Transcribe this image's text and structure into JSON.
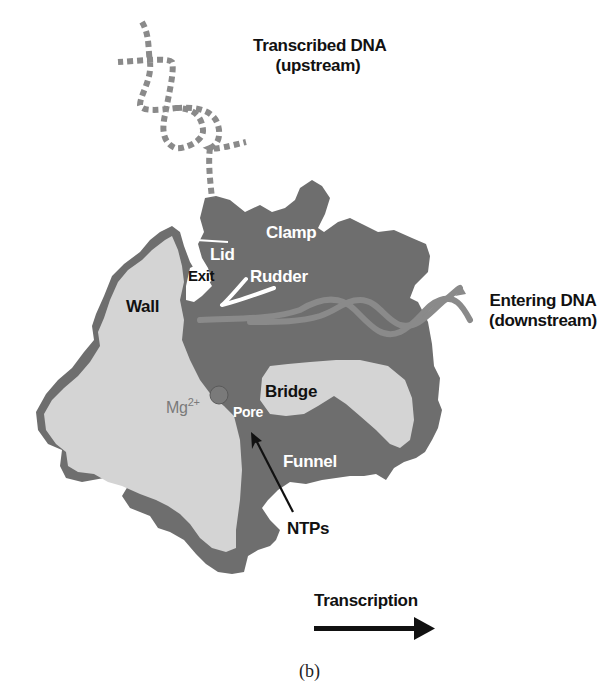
{
  "figure": {
    "panel_label": "(b)",
    "colors": {
      "background": "#ffffff",
      "protein_dark": "#6e6e6e",
      "protein_light": "#d4d4d4",
      "dna_strand": "#8a8a8a",
      "label_dark": "#111111",
      "label_light": "#ffffff",
      "mg_ion": "#7a7a7a"
    },
    "labels": {
      "transcribed_dna_line1": "Transcribed DNA",
      "transcribed_dna_line2": "(upstream)",
      "entering_dna_line1": "Entering DNA",
      "entering_dna_line2": "(downstream)",
      "clamp": "Clamp",
      "lid": "Lid",
      "exit": "Exit",
      "rudder": "Rudder",
      "wall": "Wall",
      "bridge": "Bridge",
      "mg_base": "Mg",
      "mg_charge": "2+",
      "pore": "Pore",
      "funnel": "Funnel",
      "ntps": "NTPs",
      "transcription": "Transcription"
    },
    "icons": {
      "transcription_arrow": "right-arrow",
      "ntps_arrow": "pointer-arrow",
      "mg_ion": "circle"
    }
  }
}
